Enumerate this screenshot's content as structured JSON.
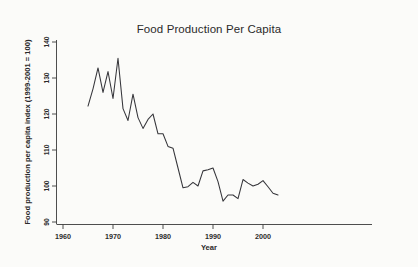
{
  "chart_data": {
    "type": "line",
    "title": "Food Production Per Capita",
    "xlabel": "Year",
    "ylabel": "Food production per capita index (1999-2001 = 100)",
    "xlim": [
      1958,
      2005
    ],
    "ylim": [
      88,
      142
    ],
    "xticks": [
      1960,
      1970,
      1980,
      1990,
      2000
    ],
    "xtick_labels": [
      "1960",
      "1970",
      "1980",
      "1990",
      "2000"
    ],
    "yticks": [
      90,
      100,
      110,
      120,
      130,
      140
    ],
    "ytick_labels": [
      "90",
      "100",
      "110",
      "120",
      "130",
      "140"
    ],
    "grid": false,
    "legend": false,
    "line_color": "#35353a",
    "series": [
      {
        "name": "Food production per capita index",
        "x": [
          1965,
          1966,
          1967,
          1968,
          1969,
          1970,
          1971,
          1972,
          1973,
          1974,
          1975,
          1976,
          1977,
          1978,
          1979,
          1980,
          1981,
          1982,
          1983,
          1984,
          1985,
          1986,
          1987,
          1988,
          1989,
          1990,
          1991,
          1992,
          1993,
          1994,
          1995,
          1996,
          1997,
          1998,
          1999,
          2000,
          2001,
          2002,
          2003
        ],
        "values": [
          122.2,
          127.0,
          132.8,
          126.0,
          131.8,
          124.3,
          135.5,
          121.5,
          118.2,
          125.5,
          119.0,
          116.0,
          118.5,
          120.0,
          114.5,
          114.5,
          111.0,
          110.5,
          105.0,
          99.5,
          99.8,
          101.0,
          100.0,
          104.2,
          104.5,
          105.0,
          101.2,
          95.8,
          97.5,
          97.5,
          96.5,
          101.8,
          100.8,
          100.0,
          100.5,
          101.5,
          99.8,
          98.0,
          97.5
        ]
      }
    ]
  }
}
